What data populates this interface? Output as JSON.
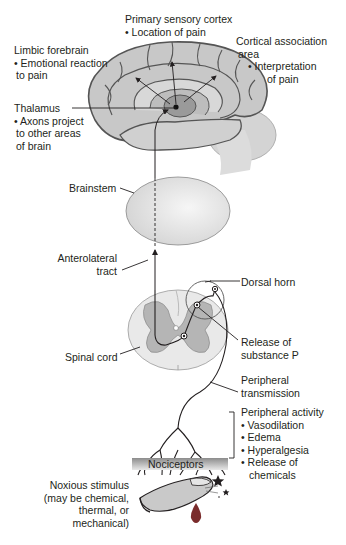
{
  "diagram": {
    "type": "pain-pathway",
    "colors": {
      "tissue_light": "#e6e6e6",
      "tissue_mid": "#c9c9c9",
      "tissue_dark": "#9a9a9a",
      "outline": "#555555",
      "line": "#231f20",
      "blood": "#7a2b2b"
    },
    "labels": {
      "primary_sensory": {
        "title": "Primary sensory cortex",
        "bullets": [
          "Location of pain"
        ]
      },
      "limbic": {
        "title": "Limbic forebrain",
        "bullets": [
          "Emotional reaction",
          "to pain"
        ]
      },
      "cortical": {
        "title": "Cortical association",
        "title2": "area",
        "bullets": [
          "Interpretation",
          "of pain"
        ]
      },
      "thalamus": {
        "title": "Thalamus",
        "bullets": [
          "Axons project",
          "to other areas",
          "of brain"
        ]
      },
      "brainstem": "Brainstem",
      "anterolateral": [
        "Anterolateral",
        "tract"
      ],
      "dorsal_horn": "Dorsal horn",
      "substance_p": [
        "Release of",
        "substance P"
      ],
      "spinal_cord": "Spinal cord",
      "peripheral_transmission": [
        "Peripheral",
        "transmission"
      ],
      "peripheral_activity": {
        "title": "Peripheral activity",
        "bullets": [
          "Vasodilation",
          "Edema",
          "Hyperalgesia",
          "Release of",
          "chemicals"
        ]
      },
      "nociceptors": "Nociceptors",
      "noxious": [
        "Noxious stimulus",
        "(may be chemical,",
        "thermal, or",
        "mechanical)"
      ]
    }
  }
}
